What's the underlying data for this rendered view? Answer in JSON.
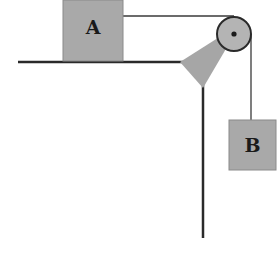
{
  "diagram": {
    "type": "pulley-system",
    "blocks": [
      {
        "id": "A",
        "label": "A",
        "position": "on table"
      },
      {
        "id": "B",
        "label": "B",
        "position": "hanging"
      }
    ],
    "colors": {
      "block_fill": "#a9a9a9",
      "block_stroke": "#8a8a8a",
      "pulley_fill": "#b4b4b4",
      "bracket_fill": "#a6a6a6",
      "line": "#2a2a2a",
      "rope": "#3a3a3a"
    }
  }
}
